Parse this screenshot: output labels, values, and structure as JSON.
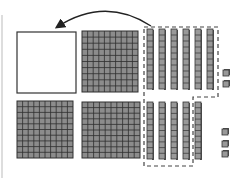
{
  "diagram": {
    "colors": {
      "block_fill": "#8c8c8c",
      "grid_line": "#2e2e2e",
      "rod_face": "#999999",
      "rod_side": "#555555",
      "outline": "#333333",
      "dashed": "#444444",
      "edge_line": "#bbbbbb"
    },
    "arrow": {
      "from": [
        151,
        26
      ],
      "control": [
        105,
        -4
      ],
      "to": [
        57,
        27
      ],
      "icon": "curved-arrow-left"
    },
    "top_row": {
      "empty_flat": {
        "x": 17,
        "y": 32,
        "w": 59,
        "h": 61
      },
      "flats": [
        {
          "x": 82,
          "y": 31,
          "w": 56,
          "h": 61,
          "grid": 10
        }
      ],
      "rods": {
        "count": 6,
        "x0": 147,
        "dx": 12,
        "y": 29,
        "w": 7,
        "h": 60,
        "units": 10
      },
      "units": [
        {
          "x": 223,
          "y": 70
        },
        {
          "x": 223,
          "y": 81
        }
      ]
    },
    "bottom_row": {
      "flats": [
        {
          "x": 17,
          "y": 101,
          "w": 56,
          "h": 57,
          "grid": 10
        },
        {
          "x": 82,
          "y": 102,
          "w": 58,
          "h": 56,
          "grid": 10
        }
      ],
      "rods": {
        "count": 5,
        "x0": 147,
        "dx": 12,
        "y": 102,
        "w": 7,
        "h": 57,
        "units": 10
      },
      "units": [
        {
          "x": 222,
          "y": 129
        },
        {
          "x": 222,
          "y": 141
        },
        {
          "x": 222,
          "y": 151
        }
      ]
    },
    "dashed_group": {
      "path": "M144,27 L218,27 L218,97 L193,97 L193,166 L144,166 Z"
    }
  }
}
